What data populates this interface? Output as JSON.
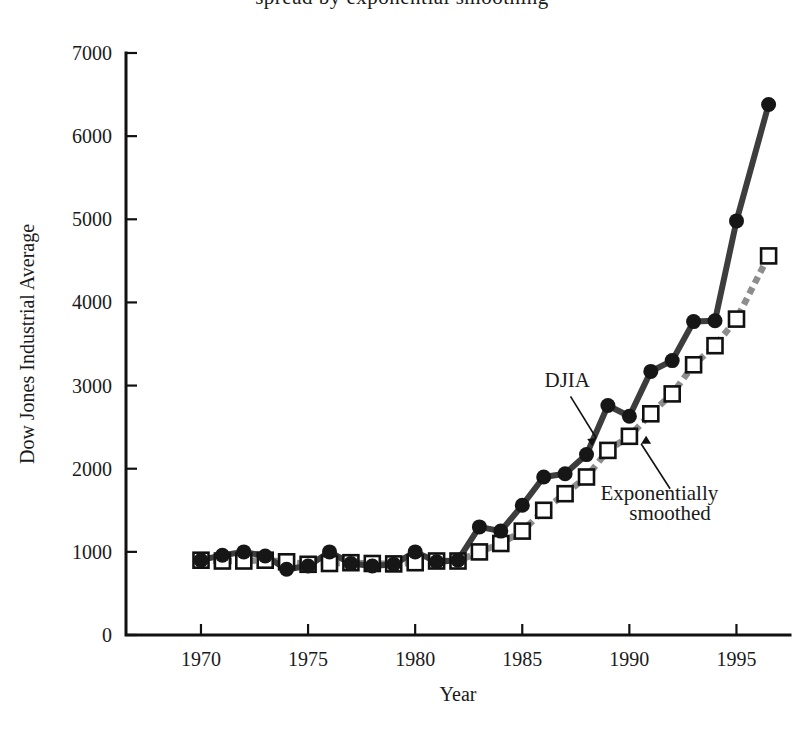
{
  "figure": {
    "cropped_title_line": "spread by exponential smoothing",
    "axis_color": "#111111",
    "djia_color": "#3d3d3d",
    "smoothed_color": "#8d8d8d"
  },
  "annotations": [
    {
      "id": "djia-annotation",
      "text": "DJIA",
      "x": 1987.1,
      "y": 2980
    },
    {
      "id": "smoothed-annotation-line1",
      "text": "Exponentially",
      "x": 1991.4,
      "y": 1620
    },
    {
      "id": "smoothed-annotation-line2",
      "text": "smoothed",
      "x": 1991.9,
      "y": 1380
    }
  ],
  "chart_data": {
    "type": "line",
    "title": "",
    "xlabel": "Year",
    "ylabel": "Dow Jones Industrial Average",
    "xlim": [
      1966.5,
      1997.5
    ],
    "ylim": [
      0,
      7000
    ],
    "xticks": [
      1970,
      1975,
      1980,
      1985,
      1990,
      1995
    ],
    "xtick_labels": [
      "1970",
      "1975",
      "1980",
      "1985",
      "1990",
      "1995"
    ],
    "yticks": [
      0,
      1000,
      2000,
      3000,
      4000,
      5000,
      6000,
      7000
    ],
    "ytick_labels": [
      "0",
      "1000",
      "2000",
      "3000",
      "4000",
      "5000",
      "6000",
      "7000"
    ],
    "grid": false,
    "legend": "annotated-inline",
    "x": [
      1970,
      1971,
      1972,
      1973,
      1974,
      1975,
      1976,
      1977,
      1978,
      1979,
      1980,
      1981,
      1982,
      1983,
      1984,
      1985,
      1986,
      1987,
      1988,
      1989,
      1990,
      1991,
      1992,
      1993,
      1994,
      1995,
      1996.5
    ],
    "series": [
      {
        "name": "DJIA",
        "marker": "filled-circle",
        "line": "solid",
        "values": [
          900,
          960,
          1000,
          950,
          790,
          830,
          1000,
          860,
          830,
          850,
          1000,
          880,
          900,
          1300,
          1250,
          1560,
          1900,
          1940,
          2170,
          2760,
          2630,
          3170,
          3300,
          3770,
          3780,
          4980,
          6380
        ]
      },
      {
        "name": "Exponentially smoothed",
        "marker": "open-square",
        "line": "dotted",
        "values": [
          900,
          890,
          890,
          900,
          880,
          850,
          860,
          870,
          860,
          855,
          870,
          890,
          890,
          1000,
          1100,
          1250,
          1500,
          1700,
          1900,
          2220,
          2390,
          2660,
          2900,
          3250,
          3480,
          3800,
          4560
        ]
      }
    ]
  }
}
